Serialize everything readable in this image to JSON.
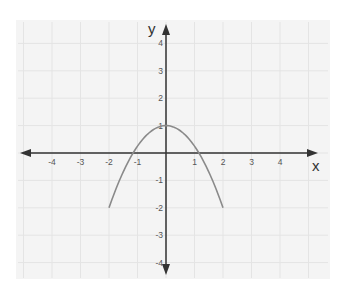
{
  "chart_data": {
    "type": "line",
    "title": "",
    "xlabel": "x",
    "ylabel": "y",
    "xlim": [
      -5,
      5
    ],
    "ylim": [
      -4.5,
      4.5
    ],
    "grid": true,
    "legend": null,
    "x_ticks": [
      "-4",
      "-3",
      "-2",
      "-1",
      "1",
      "2",
      "3",
      "4"
    ],
    "y_ticks": [
      "4",
      "3",
      "2",
      "1",
      "-1",
      "-2",
      "-3",
      "-4"
    ],
    "series": [
      {
        "name": "parabola",
        "description": "downward-opening parabola, vertex (0,1), endpoints (-2,-2) and (2,-2)",
        "x": [
          -2,
          -1.5,
          -1,
          -0.5,
          0,
          0.5,
          1,
          1.5,
          2
        ],
        "y": [
          -2,
          -0.69,
          0.25,
          0.81,
          1,
          0.81,
          0.25,
          -0.69,
          -2
        ]
      }
    ],
    "colors": {
      "curve": "#8a8a8a",
      "axes": "#333333",
      "grid": "#e4e4e4",
      "panel": "#f4f4f4"
    }
  }
}
